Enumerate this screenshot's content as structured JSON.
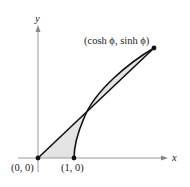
{
  "diagram": {
    "axes": {
      "x_label": "x",
      "y_label": "y"
    },
    "points": {
      "origin": "(0, 0)",
      "vertex": "(1, 0)",
      "endpoint": "(cosh ϕ, sinh ϕ)"
    },
    "colors": {
      "stroke": "#111111",
      "fill": "#e4e4e4",
      "axis": "#999999"
    }
  }
}
